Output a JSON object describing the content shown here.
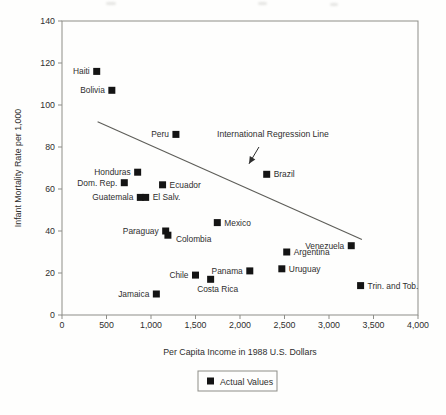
{
  "figure": {
    "background": "#fefefd",
    "ink": "#2e2e2e",
    "marker_color": "#141414",
    "box_color": "#8d8d88",
    "line_color": "#5d5d58"
  },
  "chart_data": {
    "type": "scatter",
    "title": "",
    "xlabel": "Per Capita Income in 1988 U.S. Dollars",
    "ylabel": "Infant Mortality Rate per 1,000",
    "xlim": [
      0,
      4000
    ],
    "ylim": [
      0,
      140
    ],
    "grid": false,
    "x_ticks": [
      0,
      500,
      1000,
      1500,
      2000,
      2500,
      3000,
      3500,
      4000
    ],
    "x_tick_labels": [
      "0",
      "500",
      "1,000",
      "1,500",
      "2,000",
      "2,500",
      "3,000",
      "3,500",
      "4,000"
    ],
    "y_ticks": [
      0,
      20,
      40,
      60,
      80,
      100,
      120,
      140
    ],
    "y_tick_labels": [
      "0",
      "20",
      "40",
      "60",
      "80",
      "100",
      "120",
      "140"
    ],
    "points": [
      {
        "label": "Haiti",
        "x": 390,
        "y": 116,
        "label_side": "left"
      },
      {
        "label": "Bolivia",
        "x": 560,
        "y": 107,
        "label_side": "left"
      },
      {
        "label": "Peru",
        "x": 1280,
        "y": 86,
        "label_side": "left"
      },
      {
        "label": "Honduras",
        "x": 850,
        "y": 68,
        "label_side": "left"
      },
      {
        "label": "Dom. Rep.",
        "x": 700,
        "y": 63,
        "label_side": "left"
      },
      {
        "label": "Ecuador",
        "x": 1130,
        "y": 62,
        "label_side": "right"
      },
      {
        "label": "Guatemala",
        "x": 880,
        "y": 56,
        "label_side": "left"
      },
      {
        "label": "El Salv.",
        "x": 940,
        "y": 56,
        "label_side": "right"
      },
      {
        "label": "Brazil",
        "x": 2300,
        "y": 67,
        "label_side": "right"
      },
      {
        "label": "Mexico",
        "x": 1745,
        "y": 44,
        "label_side": "right"
      },
      {
        "label": "Paraguay",
        "x": 1165,
        "y": 40,
        "label_side": "left"
      },
      {
        "label": "Colombia",
        "x": 1190,
        "y": 38,
        "label_side": "right-below"
      },
      {
        "label": "Venezuela",
        "x": 3250,
        "y": 33,
        "label_side": "left"
      },
      {
        "label": "Argentina",
        "x": 2525,
        "y": 30,
        "label_side": "right"
      },
      {
        "label": "Panama",
        "x": 2110,
        "y": 21,
        "label_side": "left"
      },
      {
        "label": "Uruguay",
        "x": 2470,
        "y": 22,
        "label_side": "right"
      },
      {
        "label": "Chile",
        "x": 1500,
        "y": 19,
        "label_side": "left"
      },
      {
        "label": "Costa Rica",
        "x": 1670,
        "y": 17,
        "label_side": "below"
      },
      {
        "label": "Jamaica",
        "x": 1060,
        "y": 10,
        "label_side": "left"
      },
      {
        "label": "Trin. and Tob.",
        "x": 3355,
        "y": 14,
        "label_side": "right"
      }
    ],
    "regression_line": {
      "x1": 400,
      "y1": 92,
      "x2": 3370,
      "y2": 36
    },
    "annotation": {
      "text": "International Regression Line",
      "text_x": 2370,
      "text_y": 85,
      "arrow_from_x": 2213,
      "arrow_from_y": 80,
      "arrow_to_x": 2101,
      "arrow_to_y": 72
    },
    "legend": {
      "label": "Actual Values",
      "marker": "filled-square"
    }
  }
}
